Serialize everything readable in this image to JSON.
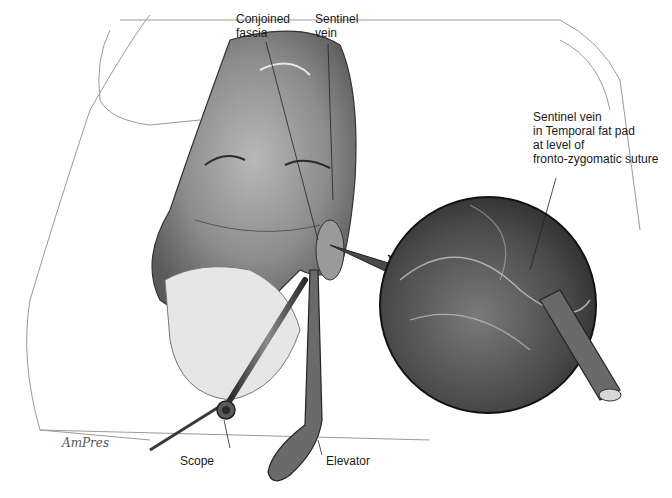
{
  "figure": {
    "type": "medical-illustration",
    "colors": {
      "background": "#ffffff",
      "ink": "#1a1a1a",
      "tissue_dark": "#4a4a4a",
      "tissue_mid": "#8a8a8a",
      "tissue_light": "#c8c8c8"
    }
  },
  "labels": {
    "conjoined_fascia": "Conjoined\nfascia",
    "sentinel_vein": "Sentinel\nvein",
    "sentinel_vein_detail": "Sentinel vein\nin Temporal fat pad\nat level of\nfronto-zygomatic suture",
    "scope": "Scope",
    "elevator": "Elevator"
  },
  "signature": "AmPres"
}
